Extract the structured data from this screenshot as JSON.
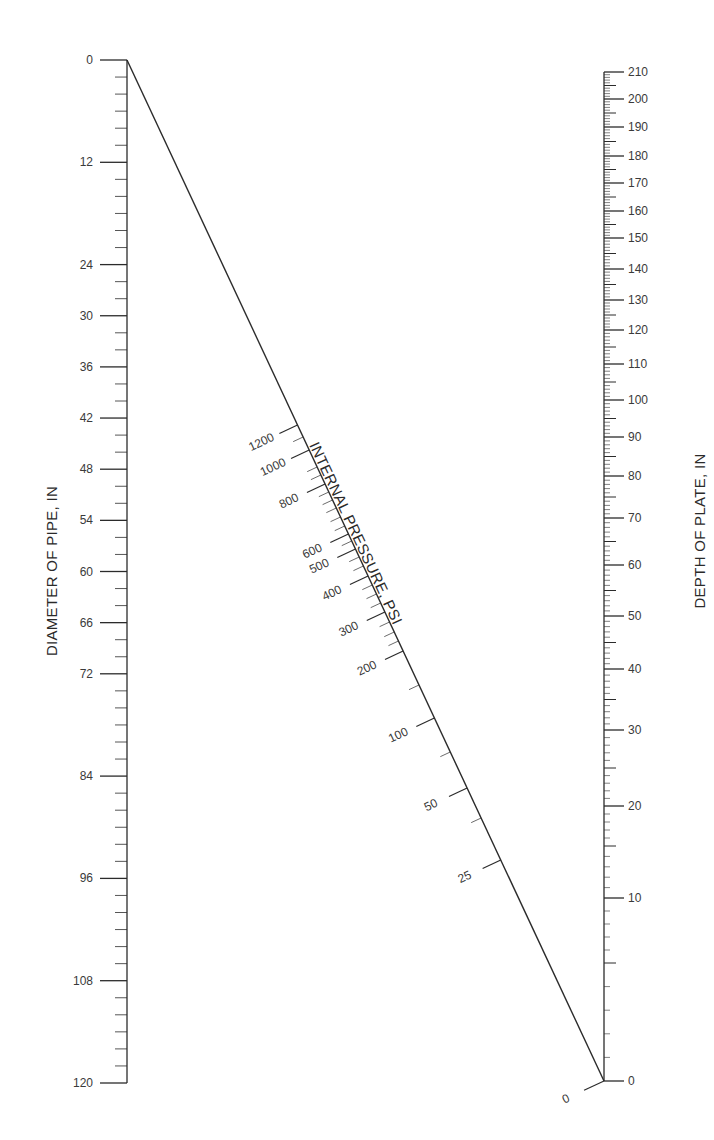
{
  "chart_data": {
    "type": "nomograph",
    "title": "",
    "scales": [
      {
        "name": "Diameter of Pipe",
        "label": "DIAMETER OF PIPE, IN",
        "position": "left",
        "range": [
          0,
          120
        ],
        "scale": "linear",
        "tick_labels": [
          "0",
          "12",
          "24",
          "30",
          "36",
          "42",
          "48",
          "54",
          "60",
          "66",
          "72",
          "84",
          "96",
          "108",
          "120"
        ],
        "tick_values": [
          0,
          12,
          24,
          30,
          36,
          42,
          48,
          54,
          60,
          66,
          72,
          84,
          96,
          108,
          120
        ],
        "minor_step": 2
      },
      {
        "name": "Internal Pressure",
        "label": "INTERNAL PRESSURE, PSI",
        "position": "diagonal",
        "scale": "nonlinear",
        "tick_labels": [
          "1200",
          "1000",
          "800",
          "600",
          "500",
          "400",
          "300",
          "200",
          "100",
          "50",
          "25",
          "0"
        ],
        "tick_values": [
          1200,
          1000,
          800,
          600,
          500,
          400,
          300,
          200,
          100,
          50,
          25,
          0
        ]
      },
      {
        "name": "Depth of Plate",
        "label": "DEPTH OF PLATE, IN",
        "position": "right",
        "range": [
          0,
          210
        ],
        "scale": "nonlinear",
        "tick_labels": [
          "210",
          "200",
          "190",
          "180",
          "170",
          "160",
          "150",
          "140",
          "130",
          "120",
          "110",
          "100",
          "90",
          "80",
          "70",
          "60",
          "50",
          "40",
          "30",
          "20",
          "10",
          "0"
        ],
        "tick_values": [
          210,
          200,
          190,
          180,
          170,
          160,
          150,
          140,
          130,
          120,
          110,
          100,
          90,
          80,
          70,
          60,
          50,
          40,
          30,
          20,
          10,
          0
        ]
      }
    ],
    "grid": false,
    "legend": "none"
  },
  "labels": {
    "left_axis_title": "DIAMETER OF PIPE, IN",
    "right_axis_title": "DEPTH OF PLATE, IN",
    "diagonal_title": "INTERNAL PRESSURE, PSI"
  }
}
